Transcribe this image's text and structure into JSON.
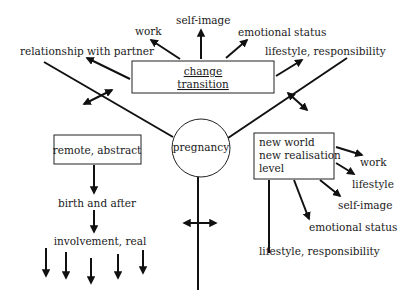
{
  "diagram": {
    "center": {
      "label": "pregnancy"
    },
    "top_box": {
      "line1": "change",
      "line2": "transition",
      "arrows_to": [
        "relationship with partner",
        "work",
        "self-image",
        "emotional status",
        "lifestyle, responsibility"
      ]
    },
    "top_labels": {
      "relationship": "relationship with partner",
      "work": "work",
      "self_image": "self-image",
      "emotional": "emotional status",
      "lifestyle": "lifestyle, responsibility"
    },
    "left_box": {
      "label": "remote, abstract"
    },
    "left_chain": {
      "step1": "birth and after",
      "step2": "involvement, real",
      "arrow_count": 5
    },
    "right_box": {
      "line1": "new world",
      "line2": "new realisation",
      "line3": "level"
    },
    "right_labels": {
      "work": "work",
      "lifestyle": "lifestyle",
      "self_image": "self-image",
      "emotional": "emotional status",
      "lifestyle_resp": "lifestyle, responsibility"
    },
    "colors": {
      "line": "#111111",
      "background": "#ffffff",
      "text": "#1a1a1a"
    }
  }
}
